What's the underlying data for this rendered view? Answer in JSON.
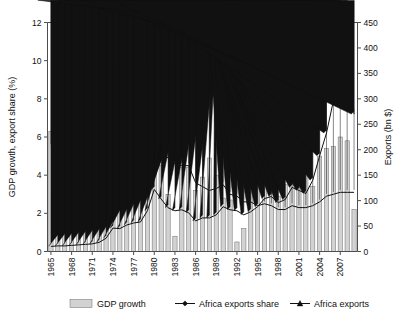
{
  "chart_data": {
    "type": "bar",
    "title": "",
    "subtitle": "",
    "xlabel": "",
    "ylabel": "GDP growth, export share (%)",
    "y2label": "Exports (bn $)",
    "ylim": [
      0,
      12
    ],
    "y2lim": [
      0,
      450
    ],
    "yticks": [
      0,
      2,
      4,
      6,
      8,
      10,
      12
    ],
    "y2ticks": [
      0,
      50,
      100,
      150,
      200,
      250,
      300,
      350,
      400,
      450
    ],
    "grid": false,
    "legend_position": "bottom",
    "xtick_labels": [
      "1965",
      "1968",
      "1971",
      "1974",
      "1977",
      "1980",
      "1983",
      "1986",
      "1989",
      "1992",
      "1995",
      "1998",
      "2001",
      "2004",
      "2007"
    ],
    "xtick_step": 3,
    "categories": [
      1965,
      1966,
      1967,
      1968,
      1969,
      1970,
      1971,
      1972,
      1973,
      1974,
      1975,
      1976,
      1977,
      1978,
      1979,
      1980,
      1981,
      1982,
      1983,
      1984,
      1985,
      1986,
      1987,
      1988,
      1989,
      1990,
      1991,
      1992,
      1993,
      1994,
      1995,
      1996,
      1997,
      1998,
      1999,
      2000,
      2001,
      2002,
      2003,
      2004,
      2005,
      2006,
      2007,
      2008,
      2009
    ],
    "series": [
      {
        "name": "GDP growth",
        "type": "bar",
        "axis": "left",
        "unit": "%",
        "color": "#d2d2d2",
        "values": [
          6.3,
          1.3,
          4.4,
          4.4,
          7.9,
          8.3,
          5.0,
          4.6,
          8.0,
          4.0,
          3.5,
          2.7,
          2.7,
          3.6,
          5.9,
          9.8,
          4.5,
          3.0,
          0.8,
          4.4,
          4.4,
          3.2,
          3.9,
          4.9,
          4.0,
          2.8,
          2.7,
          0.5,
          1.2,
          3.8,
          5.5,
          4.5,
          3.6,
          2.9,
          3.5,
          4.3,
          3.6,
          4.5,
          3.4,
          5.0,
          5.4,
          5.5,
          6.0,
          5.8,
          2.2
        ]
      },
      {
        "name": "Africa exports share",
        "type": "line",
        "axis": "left",
        "unit": "%",
        "marker": "diamond",
        "color": "#111111",
        "values": [
          5.5,
          5.3,
          5.2,
          5.3,
          5.2,
          5.3,
          5.4,
          5.3,
          5.2,
          5.8,
          5.5,
          5.3,
          5.1,
          4.6,
          4.9,
          5.9,
          5.2,
          4.9,
          4.6,
          4.5,
          4.5,
          3.6,
          3.4,
          3.2,
          3.3,
          3.5,
          3.0,
          2.9,
          2.6,
          2.6,
          2.4,
          2.5,
          2.4,
          2.2,
          2.2,
          2.4,
          2.3,
          2.3,
          2.4,
          2.6,
          2.9,
          3.0,
          3.1,
          3.1,
          3.1
        ]
      },
      {
        "name": "Africa exports",
        "type": "line",
        "axis": "right",
        "unit": "bn $",
        "marker": "triangle",
        "color": "#111111",
        "values": [
          10,
          11,
          11,
          12,
          13,
          14,
          15,
          18,
          26,
          46,
          45,
          52,
          56,
          58,
          80,
          122,
          103,
          86,
          80,
          82,
          76,
          60,
          66,
          66,
          72,
          88,
          82,
          80,
          72,
          78,
          88,
          104,
          108,
          96,
          102,
          126,
          120,
          114,
          140,
          188,
          233,
          296,
          362,
          420,
          270
        ]
      }
    ],
    "legend": [
      {
        "label": "GDP growth",
        "marker": "bar"
      },
      {
        "label": "Africa exports share",
        "marker": "diamond-line"
      },
      {
        "label": "Africa exports",
        "marker": "triangle-line"
      }
    ]
  }
}
